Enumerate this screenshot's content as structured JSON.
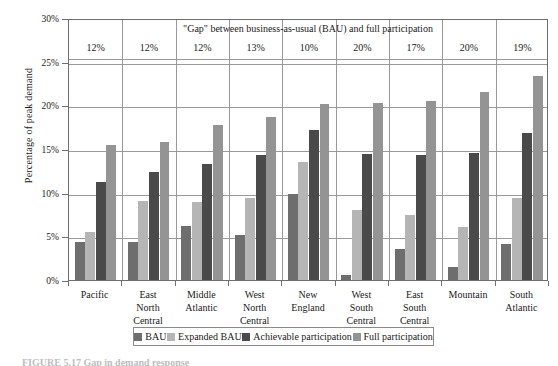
{
  "chart_data": {
    "type": "bar",
    "title": "\"Gap\" between business-as-usual (BAU) and full participation",
    "xlabel": "",
    "ylabel": "Percentage of peak demand",
    "ylim": [
      0,
      30
    ],
    "ytick_labels": [
      "0%",
      "5%",
      "10%",
      "15%",
      "20%",
      "25%",
      "30%"
    ],
    "ytick_values": [
      0,
      5,
      10,
      15,
      20,
      25,
      30
    ],
    "grid": true,
    "legend_position": "bottom",
    "categories": [
      "Pacific",
      "East North Central",
      "Middle Atlantic",
      "West North Central",
      "New England",
      "West South Central",
      "East South Central",
      "Mountain",
      "South Atlantic"
    ],
    "category_lines": [
      [
        "Pacific"
      ],
      [
        "East",
        "North",
        "Central"
      ],
      [
        "Middle",
        "Atlantic"
      ],
      [
        "West",
        "North",
        "Central"
      ],
      [
        "New",
        "England"
      ],
      [
        "West",
        "South",
        "Central"
      ],
      [
        "East",
        "South",
        "Central"
      ],
      [
        "Mountain"
      ],
      [
        "South",
        "Atlantic"
      ]
    ],
    "gap_labels": [
      "12%",
      "12%",
      "12%",
      "13%",
      "10%",
      "20%",
      "17%",
      "20%",
      "19%"
    ],
    "series": [
      {
        "name": "BAU",
        "color": "#6e6e6e",
        "values": [
          4.4,
          4.3,
          6.2,
          5.2,
          9.8,
          0.6,
          3.5,
          1.5,
          4.1
        ]
      },
      {
        "name": "Expanded BAU",
        "color": "#b5b5b5",
        "values": [
          5.5,
          9.0,
          8.9,
          9.4,
          13.5,
          8.0,
          7.4,
          6.1,
          9.4
        ]
      },
      {
        "name": "Achievable participation",
        "color": "#4a4a4a",
        "values": [
          11.2,
          12.4,
          13.3,
          14.3,
          17.2,
          14.4,
          14.3,
          14.6,
          16.8
        ]
      },
      {
        "name": "Full participation",
        "color": "#949494",
        "values": [
          15.5,
          15.8,
          17.8,
          18.7,
          20.1,
          20.3,
          20.5,
          21.5,
          23.4
        ]
      }
    ]
  },
  "caption": "FIGURE 5.17    Gap in demand response",
  "axis_color": "#6f6f6f",
  "grid_color": "#9a9a9a"
}
